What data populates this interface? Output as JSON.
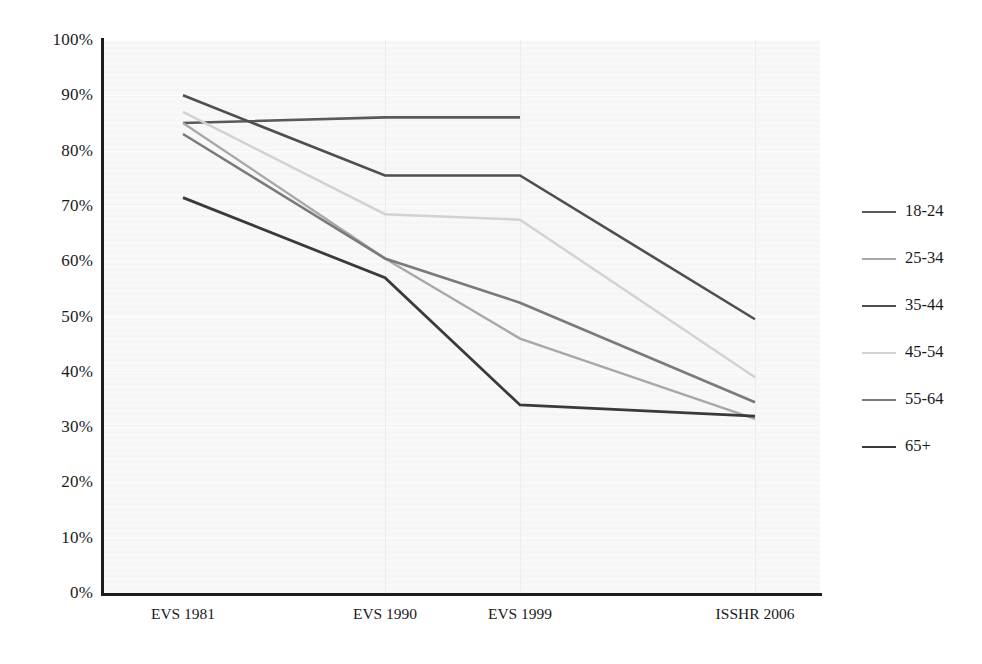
{
  "chart_data": {
    "type": "line",
    "title": "",
    "subtitle": "",
    "xlabel": "",
    "ylabel": "",
    "categories": [
      "EVS 1981",
      "EVS 1990",
      "EVS 1999",
      "ISSHR 2006"
    ],
    "ylim": [
      0,
      100
    ],
    "yticks": [
      "0%",
      "10%",
      "20%",
      "30%",
      "40%",
      "50%",
      "60%",
      "70%",
      "80%",
      "90%",
      "100%"
    ],
    "ytick_values": [
      0,
      10,
      20,
      30,
      40,
      50,
      60,
      70,
      80,
      90,
      100
    ],
    "grid": true,
    "grid_axis": "both",
    "legend_position": "right",
    "units": "percent",
    "series": [
      {
        "name": "18-24",
        "color": "#595959",
        "width": 2.6,
        "values": [
          85,
          86,
          86,
          null
        ]
      },
      {
        "name": "25-34",
        "color": "#a8a8a8",
        "width": 2.4,
        "values": [
          85,
          60.5,
          46,
          31.5
        ]
      },
      {
        "name": "35-44",
        "color": "#4f4f4f",
        "width": 2.6,
        "values": [
          90,
          75.5,
          75.5,
          49.5
        ]
      },
      {
        "name": "45-54",
        "color": "#d2d2d2",
        "width": 2.4,
        "values": [
          87,
          68.5,
          67.5,
          39
        ]
      },
      {
        "name": "55-64",
        "color": "#7a7a7a",
        "width": 2.6,
        "values": [
          83,
          60.5,
          52.5,
          34.5
        ]
      },
      {
        "name": "65+",
        "color": "#3a3a3a",
        "width": 2.8,
        "values": [
          71.5,
          57,
          34,
          32
        ]
      }
    ]
  },
  "axes": {
    "y_axis_color": "#1d1d1d",
    "x_axis_color": "#1d1d1d",
    "plot_background": "#f7f7f7",
    "gridline_color": "#ececec"
  },
  "legend": {
    "items": [
      {
        "label": "18-24"
      },
      {
        "label": "25-34"
      },
      {
        "label": "35-44"
      },
      {
        "label": "45-54"
      },
      {
        "label": "55-64"
      },
      {
        "label": "65+"
      }
    ]
  }
}
